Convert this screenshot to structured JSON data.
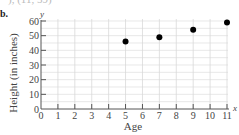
{
  "part_label": "b.",
  "top_fragment": "), (11, 59)",
  "chart_data": {
    "type": "scatter",
    "title": "",
    "xlabel": "Age",
    "ylabel": "Height (in inches)",
    "x_var": "x",
    "y_var": "y",
    "xlim": [
      0,
      11
    ],
    "ylim": [
      0,
      60
    ],
    "x_ticks": [
      0,
      1,
      2,
      3,
      4,
      5,
      6,
      7,
      8,
      9,
      10,
      11
    ],
    "y_ticks": [
      0,
      10,
      20,
      30,
      40,
      50,
      60
    ],
    "grid": true,
    "legend": "none",
    "points": [
      {
        "x": 5,
        "y": 46
      },
      {
        "x": 7,
        "y": 49
      },
      {
        "x": 9,
        "y": 54
      },
      {
        "x": 11,
        "y": 59
      }
    ],
    "colors": {
      "point": "#000000",
      "grid": "#d9d9d9",
      "axis": "#555555"
    }
  }
}
